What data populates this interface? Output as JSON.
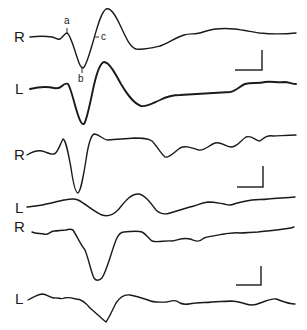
{
  "figure": {
    "traces": [
      {
        "label": "R",
        "label_pos": [
          14,
          29
        ],
        "style": "normal",
        "path": "M30,37 C38,36 46,36 52,37 C56,38 58,40 60,39 C63,37 65,33 67,33 C70,34 73,45 77,57 C79,64 81,68 83,68 C86,67 89,55 93,42 C97,28 101,12 106,9 C111,7 116,16 121,27 C126,38 130,47 136,49 C145,50 152,48 160,46 C168,43 175,38 184,35 C190,33 196,35 203,32 C212,29 224,28 234,29 C244,30 252,32 260,33 C270,34 285,34 296,33"
      },
      {
        "label": "L",
        "label_pos": [
          14,
          81
        ],
        "style": "bold",
        "path": "M30,89 C38,87 46,86 54,88 C58,89 60,88 62,86 C64,84 66,83 68,84 C71,88 74,103 78,115 C80,121 82,125 84,124 C87,120 90,103 94,85 C97,72 100,63 104,62 C109,62 115,73 121,84 C127,94 133,103 141,106 C147,107 153,103 160,100 C166,97 172,95 180,95 C195,94 215,93 230,92 C236,91 240,86 245,84 C252,82 258,84 265,82 C272,81 278,83 284,82 C289,82 292,84 296,84"
      },
      {
        "label": "R",
        "label_pos": [
          14,
          147
        ],
        "style": "normal",
        "path": "M27,155 C32,152 37,150 42,151 C47,152 50,155 54,154 C58,153 60,144 63,139 C66,140 68,152 71,168 C73,182 75,193 78,193 C81,191 83,178 86,160 C88,146 90,136 94,134 C99,134 103,140 108,140 C118,139 126,139 134,138 C142,138 148,138 152,141 C157,146 161,154 165,157 C170,158 174,152 180,148 C186,145 192,148 199,150 C205,151 209,145 215,143 C221,141 225,147 231,147 C237,147 240,141 246,137 C252,135 256,141 260,141 C264,138 267,135 273,136 C279,136 286,135 296,135"
      },
      {
        "label": "L",
        "label_pos": [
          14,
          200
        ],
        "style": "normal",
        "path": "M27,207 C34,206 40,206 46,204 C53,203 58,201 64,200 C70,199 74,198 78,200 C86,204 94,212 102,215 C108,217 113,215 118,210 C124,203 130,194 138,194 C144,194 150,202 156,210 C160,214 164,215 170,213 C177,211 183,209 190,207 C196,206 200,203 208,202 C214,202 218,203 224,204 C228,205 230,206 234,204 C240,202 246,201 252,200 C258,199 262,200 268,199 C276,198 284,198 295,197"
      },
      {
        "label": "R",
        "label_pos": [
          14,
          219
        ],
        "style": "normal",
        "path": "M32,232 C36,234 40,233 44,234 C48,236 50,231 54,231 C58,231 62,230 66,230 C69,229 71,229 73,230 C77,236 80,244 85,250 C89,260 91,272 94,278 C96,281 99,281 102,278 C107,270 111,253 116,240 C118,235 120,232 124,232 C130,232 136,230 142,232 C146,234 148,238 152,241 C158,243 165,240 172,241 C178,240 184,237 190,239 C196,241 198,243 204,238 C210,236 218,235 224,234 C232,233 236,232 240,233 C246,233 252,232 258,232 C264,231 270,231 276,230 C282,229 288,229 294,227"
      },
      {
        "label": "L",
        "label_pos": [
          14,
          291
        ],
        "style": "normal",
        "path": "M28,300 C33,297 37,295 42,294 C47,294 50,298 54,298 C58,297 61,300 64,298 C68,297 72,298 76,299 C82,299 86,303 90,308 C96,313 101,318 106,322 C109,318 112,311 116,303 C120,297 124,294 130,295 C136,296 142,298 148,300 C154,303 160,302 166,302 C172,301 175,299 180,303 C186,306 190,303 196,303 C202,302 206,303 212,302 C218,301 224,302 230,301 C236,301 240,302 246,304 C252,306 256,305 260,303 C266,301 272,298 276,299 C282,301 288,304 295,304"
      }
    ],
    "peak_labels": [
      {
        "text": "a",
        "x": 64,
        "y": 16
      },
      {
        "text": "b",
        "x": 78,
        "y": 74
      },
      {
        "text": "c",
        "x": 101,
        "y": 32
      }
    ],
    "peak_ticks": [
      {
        "x1": 67,
        "y1": 28,
        "x2": 67,
        "y2": 33
      },
      {
        "x1": 82,
        "y1": 68,
        "x2": 82,
        "y2": 73
      },
      {
        "x1": 94,
        "y1": 37,
        "x2": 99,
        "y2": 37
      }
    ],
    "scale_bars": [
      {
        "path": "M235,70 L262,70 L262,50"
      },
      {
        "path": "M237,187 L263,187 L263,166"
      },
      {
        "path": "M236,285 L261,285 L261,266"
      }
    ],
    "colors": {
      "ink": "#1a1a1a",
      "background": "#ffffff"
    }
  }
}
